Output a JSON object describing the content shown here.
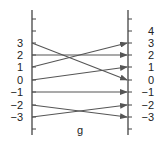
{
  "diagram": {
    "type": "mapping-diagram",
    "function_label": "g",
    "domain": [
      3,
      2,
      1,
      0,
      -1,
      -2,
      -3
    ],
    "codomain": [
      4,
      3,
      2,
      1,
      0,
      -1,
      -2,
      -3
    ],
    "mappings": [
      {
        "from": 3,
        "to": 0
      },
      {
        "from": 2,
        "to": 2
      },
      {
        "from": 1,
        "to": 3
      },
      {
        "from": 0,
        "to": 1
      },
      {
        "from": -1,
        "to": -1
      },
      {
        "from": -2,
        "to": -3
      },
      {
        "from": -3,
        "to": -2
      }
    ],
    "left_labels": [
      "3",
      "2",
      "1",
      "0",
      "−1",
      "−2",
      "−3"
    ],
    "right_labels": [
      "4",
      "3",
      "2",
      "1",
      "0",
      "−1",
      "−2",
      "−3"
    ],
    "colors": {
      "line": "#555555",
      "axis": "#444444",
      "text": "#222222"
    }
  }
}
